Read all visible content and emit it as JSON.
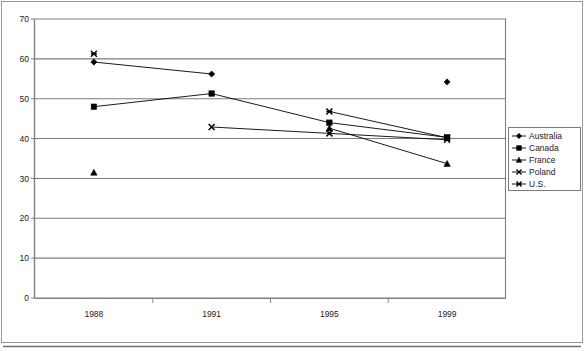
{
  "chart_data": {
    "type": "line",
    "title": "",
    "subtitle": "",
    "xlabel": "",
    "ylabel": "",
    "categories": [
      "1988",
      "1991",
      "1995",
      "1999"
    ],
    "ylim": [
      0,
      70
    ],
    "ytick_step": 10,
    "yticks": [
      "0",
      "10",
      "20",
      "30",
      "40",
      "50",
      "60",
      "70"
    ],
    "grid": "horizontal",
    "legend_position": "right",
    "series": [
      {
        "name": "Australia",
        "marker": "diamond",
        "color": "#000000",
        "values": [
          59.2,
          56.2,
          null,
          54.2
        ],
        "connected_segments": [
          [
            0,
            1
          ]
        ]
      },
      {
        "name": "Canada",
        "marker": "square",
        "color": "#000000",
        "values": [
          48.0,
          51.3,
          44.0,
          40.3
        ],
        "connected_segments": [
          [
            0,
            1
          ],
          [
            1,
            2
          ],
          [
            2,
            3
          ]
        ]
      },
      {
        "name": "France",
        "marker": "triangle",
        "color": "#000000",
        "values": [
          31.5,
          null,
          42.6,
          33.7
        ],
        "connected_segments": [
          [
            2,
            3
          ]
        ]
      },
      {
        "name": "Poland",
        "marker": "cross-x",
        "color": "#000000",
        "values": [
          null,
          42.9,
          41.3,
          39.7
        ],
        "connected_segments": [
          [
            1,
            2
          ],
          [
            2,
            3
          ]
        ]
      },
      {
        "name": "U.S.",
        "marker": "asterisk",
        "color": "#000000",
        "values": [
          61.3,
          null,
          46.8,
          40.2
        ],
        "connected_segments": [
          [
            2,
            3
          ]
        ]
      }
    ]
  },
  "legend": {
    "entries": [
      {
        "label": "Australia",
        "marker": "diamond"
      },
      {
        "label": "Canada",
        "marker": "square"
      },
      {
        "label": "France",
        "marker": "triangle"
      },
      {
        "label": "Poland",
        "marker": "cross-x"
      },
      {
        "label": "U.S.",
        "marker": "asterisk"
      }
    ]
  },
  "axis": {
    "y_labels": [
      "70",
      "60",
      "50",
      "40",
      "30",
      "20",
      "10",
      "0"
    ],
    "x_labels": [
      "1988",
      "1991",
      "1995",
      "1999"
    ]
  }
}
